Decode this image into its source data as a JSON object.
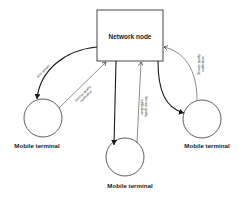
{
  "diagram": {
    "network_node": {
      "label": "Network node"
    },
    "terminals": [
      {
        "id": "left",
        "label": "Mobile terminal"
      },
      {
        "id": "middle",
        "label": "Mobile terminal"
      },
      {
        "id": "right",
        "label": "Mobile terminal"
      }
    ],
    "edges": [
      {
        "from": "network_node",
        "to": "left",
        "label": "RTP stream",
        "style": "bold"
      },
      {
        "from": "left",
        "to": "network_node",
        "label_line1": "Service quality",
        "label_line2": "notification",
        "style": "thin"
      },
      {
        "from": "network_node",
        "to": "middle",
        "label": "",
        "style": "bold"
      },
      {
        "from": "middle",
        "to": "network_node",
        "label_line1": "Service quality",
        "label_line2": "notification",
        "style": "thin"
      },
      {
        "from": "network_node",
        "to": "right",
        "label": "",
        "style": "bold"
      },
      {
        "from": "right",
        "to": "network_node",
        "label_line1": "Service quality",
        "label_line2": "notification",
        "style": "thin"
      }
    ],
    "colors": {
      "stroke": "#1a1a1a",
      "background": "#ffffff"
    }
  }
}
